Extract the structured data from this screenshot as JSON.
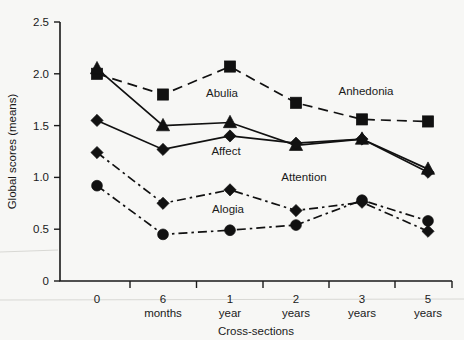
{
  "chart_data": {
    "type": "line",
    "title": "",
    "xlabel": "Cross-sections",
    "ylabel": "Global scores (means)",
    "categories": [
      "0",
      "6 months",
      "1 year",
      "2 years",
      "3 years",
      "5 years"
    ],
    "category_lines": [
      [
        "0",
        ""
      ],
      [
        "6",
        "months"
      ],
      [
        "1",
        "year"
      ],
      [
        "2",
        "years"
      ],
      [
        "3",
        "years"
      ],
      [
        "5",
        "years"
      ]
    ],
    "ylim": [
      0,
      2.5
    ],
    "yticks": [
      0,
      0.5,
      1.0,
      1.5,
      2.0,
      2.5
    ],
    "ytick_labels": [
      "0",
      "0.5",
      "1.0",
      "1.5",
      "2.0",
      "2.5"
    ],
    "grid": false,
    "legend": "inline-annotations",
    "series": [
      {
        "name": "Anhedonia",
        "marker": "square",
        "linestyle": "dashed",
        "values": [
          2.0,
          1.8,
          2.07,
          1.72,
          1.56,
          1.54
        ]
      },
      {
        "name": "Abulia",
        "marker": "triangle",
        "linestyle": "solid",
        "values": [
          2.05,
          1.5,
          1.53,
          1.31,
          1.37,
          1.08
        ]
      },
      {
        "name": "Affect",
        "marker": "diamond",
        "linestyle": "solid",
        "values": [
          1.55,
          1.27,
          1.4,
          1.33,
          1.37,
          1.05
        ]
      },
      {
        "name": "Attention",
        "marker": "diamond",
        "linestyle": "dash-dot",
        "values": [
          1.24,
          0.75,
          0.88,
          0.68,
          0.76,
          0.48
        ]
      },
      {
        "name": "Alogia",
        "marker": "circle",
        "linestyle": "dash-dot",
        "values": [
          0.92,
          0.45,
          0.49,
          0.54,
          0.78,
          0.58
        ]
      }
    ],
    "annotations": [
      {
        "text": "Abulia",
        "x_cat": 2,
        "value": 1.78,
        "dx": -8,
        "dy": 0
      },
      {
        "text": "Anhedonia",
        "x_cat": 4,
        "value": 1.8,
        "dx": 4,
        "dy": 0
      },
      {
        "text": "Affect",
        "x_cat": 2,
        "value": 1.22,
        "dx": -4,
        "dy": 0
      },
      {
        "text": "Attention",
        "x_cat": 3,
        "value": 0.97,
        "dx": 8,
        "dy": 0
      },
      {
        "text": "Alogia",
        "x_cat": 2,
        "value": 0.66,
        "dx": -2,
        "dy": 0
      }
    ]
  }
}
